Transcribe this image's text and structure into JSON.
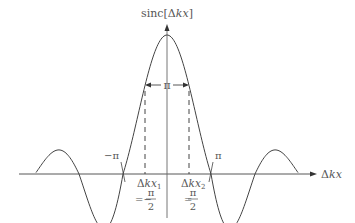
{
  "chart_data": {
    "type": "line",
    "title": "",
    "function": "sinc[Δkx]",
    "ylabel": "sinc[Δkx]",
    "xlabel": "Δkx",
    "annotations": [
      {
        "text": "π",
        "note": "width between half-power points"
      },
      {
        "text": "−π",
        "note": "first zero crossing (left)"
      },
      {
        "text": "π",
        "note": "first zero crossing (right)"
      },
      {
        "text": "Δkx₁ = −π/2",
        "note": "left dashed marker"
      },
      {
        "text": "Δkx₂ = π/2",
        "note": "right dashed marker"
      }
    ],
    "x_range": [
      "-2π",
      "2π"
    ],
    "key_points": [
      {
        "x": "-π",
        "y": 0
      },
      {
        "x": "-π/2",
        "y": "≈0.64"
      },
      {
        "x": 0,
        "y": 1
      },
      {
        "x": "π/2",
        "y": "≈0.64"
      },
      {
        "x": "π",
        "y": 0
      }
    ],
    "grid": false
  },
  "labels": {
    "y_axis": {
      "main": "sinc[Δ",
      "k": "k",
      "x": "x",
      "close": "]"
    },
    "x_axis": {
      "delta": "Δ",
      "k": "k",
      "x": "x"
    },
    "width": "π",
    "neg_pi": "−π",
    "pos_pi": "π",
    "dk1": {
      "delta": "Δ",
      "k": "k",
      "x": "x",
      "sub": "1",
      "eq": "=−",
      "num": "π",
      "den": "2"
    },
    "dk2": {
      "delta": "Δ",
      "k": "k",
      "x": "x",
      "sub": "2",
      "eq": "=",
      "num": "π",
      "den": "2"
    }
  }
}
